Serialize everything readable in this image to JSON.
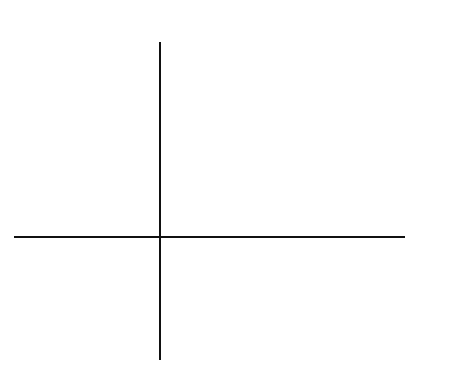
{
  "figure": {
    "title": "",
    "x_axis_label": "x",
    "y_axis_label": "y",
    "tick_label": "10",
    "colors": {
      "line": "#0a0a0a",
      "grid": "#555555",
      "background": "#ffffff"
    }
  },
  "grid": {
    "unit_per_cell": 2,
    "x_range": [
      -12,
      20
    ],
    "y_range": [
      -10,
      16
    ],
    "origin_px": [
      160,
      237
    ],
    "cell_px": [
      23.25,
      24
    ],
    "vertical_lines_px": [
      20,
      43,
      66,
      90,
      113,
      136,
      160,
      183,
      206,
      229,
      252,
      276,
      299,
      322,
      345,
      369,
      392
    ],
    "horizontal_lines_px": [
      45,
      69,
      93,
      117,
      141,
      165,
      189,
      213,
      237,
      261,
      285,
      309,
      333,
      357
    ]
  },
  "bird": {
    "outline_points_grid": [
      [
        0,
        6
      ],
      [
        7,
        9
      ],
      [
        9,
        12
      ],
      [
        11,
        13
      ],
      [
        12.5,
        12
      ],
      [
        13.6,
        10.8
      ],
      [
        17,
        10
      ],
      [
        14,
        9
      ],
      [
        11,
        1
      ],
      [
        3,
        -3.4
      ],
      [
        4.4,
        -7
      ],
      [
        7.3,
        -8
      ],
      [
        4,
        -7.4
      ],
      [
        0.7,
        -8
      ],
      [
        3,
        -7
      ],
      [
        2,
        -4
      ],
      [
        -2,
        -2
      ],
      [
        -9,
        -5
      ],
      [
        0,
        6
      ]
    ],
    "outline_points_px": "160,164 241,130 267,94 286,85 305,91 318,108 356,118 320,130 287,226 196,278 211,322 245,332 205,326 168,332 193,323 181,287 136,262 53,296 160,164",
    "eye": {
      "cx": 306,
      "cy": 108,
      "rx": 5,
      "ry": 6
    }
  }
}
